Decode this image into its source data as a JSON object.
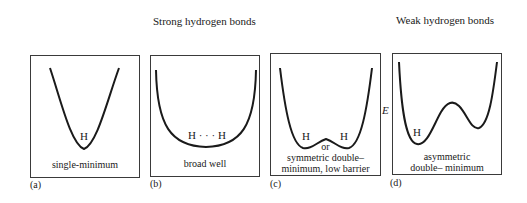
{
  "headers": {
    "strong": "Strong hydrogen bonds",
    "weak": "Weak hydrogen bonds"
  },
  "axis": {
    "energy_label": "E"
  },
  "panels": [
    {
      "letter": "(a)",
      "h_label": "H",
      "caption": [
        "single-minimum"
      ],
      "shape": "single-minimum"
    },
    {
      "letter": "(b)",
      "h_label": "H · · · H",
      "caption": [
        "broad well"
      ],
      "shape": "broad-well"
    },
    {
      "letter": "(c)",
      "h_label_left": "H",
      "h_label_right": "H",
      "or_label": "or",
      "caption": [
        "symmetric double–",
        "minimum, low barrier"
      ],
      "shape": "symmetric-double-minimum"
    },
    {
      "letter": "(d)",
      "h_label": "H",
      "caption": [
        "asymmetric",
        "double– minimum"
      ],
      "shape": "asymmetric-double-minimum"
    }
  ],
  "colors": {
    "line": "#1a1a1a",
    "border": "#3a3a3a",
    "background": "#ffffff"
  }
}
